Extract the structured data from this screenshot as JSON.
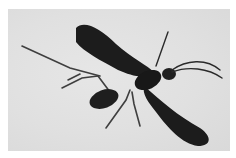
{
  "image": {
    "subject": "dark winged insect (wasp) on light background",
    "colors": {
      "border": "#ffffff",
      "background": "#e0e0e0",
      "insect": "#1c1c1c",
      "legs": "#3a3a3a"
    }
  }
}
